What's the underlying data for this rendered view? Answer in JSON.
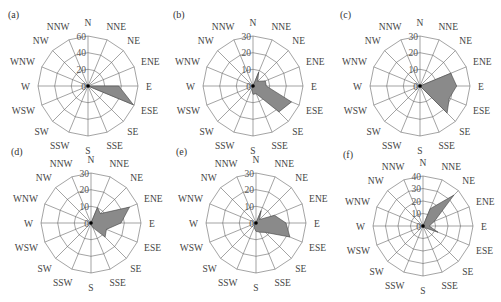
{
  "directions": [
    "N",
    "NNE",
    "NE",
    "ENE",
    "E",
    "ESE",
    "SE",
    "SSE",
    "S",
    "SSW",
    "SW",
    "WSW",
    "W",
    "WNW",
    "NW",
    "NNW"
  ],
  "colors": {
    "fill": "#8a8a8a",
    "grid": "#666666",
    "text": "#444444"
  },
  "chart_data": [
    {
      "type": "radar",
      "panel": "(a)",
      "title": "(a)",
      "max": 60,
      "ticks": [
        0,
        20,
        40,
        60
      ],
      "center": [
        88,
        86
      ],
      "values": [
        0,
        0,
        0,
        0,
        37,
        59,
        0,
        0,
        0,
        0,
        0,
        0,
        0,
        0,
        0,
        0
      ]
    },
    {
      "type": "radar",
      "panel": "(b)",
      "title": "(b)",
      "max": 30,
      "ticks": [
        0,
        10,
        20,
        30
      ],
      "center": [
        253,
        86
      ],
      "values": [
        0,
        9,
        4,
        8,
        8,
        25,
        22,
        5,
        5,
        2,
        0,
        0,
        0,
        0,
        0,
        0
      ]
    },
    {
      "type": "radar",
      "panel": "(c)",
      "title": "(c)",
      "max": 30,
      "ticks": [
        0,
        10,
        20,
        30
      ],
      "center": [
        420,
        86
      ],
      "values": [
        0,
        0,
        0,
        20,
        22,
        19,
        23,
        0,
        0,
        0,
        0,
        0,
        0,
        0,
        0,
        0
      ]
    },
    {
      "type": "radar",
      "panel": "(d)",
      "title": "(d)",
      "max": 30,
      "ticks": [
        0,
        10,
        20,
        30
      ],
      "center": [
        91,
        223
      ],
      "values": [
        0,
        10,
        8,
        25,
        18,
        10,
        12,
        3,
        1,
        0,
        0,
        0,
        0,
        0,
        0,
        0
      ]
    },
    {
      "type": "radar",
      "panel": "(e)",
      "title": "(e)",
      "max": 30,
      "ticks": [
        0,
        10,
        20,
        30
      ],
      "center": [
        256,
        223
      ],
      "values": [
        0,
        8,
        3,
        12,
        18,
        22,
        8,
        6,
        5,
        3,
        1,
        0,
        1,
        0,
        0,
        0
      ]
    },
    {
      "type": "radar",
      "panel": "(f)",
      "title": "(f)",
      "max": 40,
      "ticks": [
        0,
        10,
        20,
        30,
        40
      ],
      "center": [
        423,
        226
      ],
      "values": [
        0,
        15,
        35,
        10,
        5,
        13,
        2,
        1,
        1,
        0,
        0,
        0,
        0,
        0,
        0,
        0
      ]
    }
  ]
}
